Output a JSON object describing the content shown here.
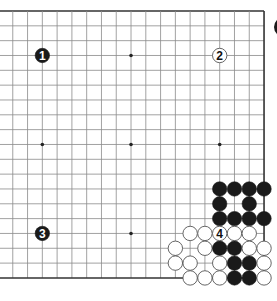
{
  "diagram": {
    "board_size": 19,
    "colors": {
      "background": "#ffffff",
      "grid_line": "#8a8a8a",
      "edge_line": "#333333",
      "black_stone": "#1a1a1a",
      "white_stone_fill": "#ffffff",
      "white_stone_stroke": "#555555",
      "star_point": "#222222"
    },
    "geometry": {
      "origin_x": -2,
      "origin_y": 11,
      "spacing_x": 14.78,
      "spacing_y": 14.83,
      "stone_radius": 7.2
    },
    "star_points": [
      [
        3,
        3
      ],
      [
        9,
        3
      ],
      [
        15,
        3
      ],
      [
        3,
        9
      ],
      [
        9,
        9
      ],
      [
        15,
        9
      ],
      [
        3,
        15
      ],
      [
        9,
        15
      ],
      [
        15,
        15
      ]
    ],
    "numbered_stones": [
      {
        "col": 3,
        "row": 3,
        "color": "black",
        "label": "1"
      },
      {
        "col": 15,
        "row": 3,
        "color": "white",
        "label": "2"
      },
      {
        "col": 3,
        "row": 15,
        "color": "black",
        "label": "3"
      },
      {
        "col": 15,
        "row": 15,
        "color": "white",
        "label": "4"
      }
    ],
    "stones": [
      {
        "col": 15,
        "row": 12,
        "color": "black"
      },
      {
        "col": 16,
        "row": 12,
        "color": "black"
      },
      {
        "col": 17,
        "row": 12,
        "color": "black"
      },
      {
        "col": 18,
        "row": 12,
        "color": "black"
      },
      {
        "col": 15,
        "row": 13,
        "color": "black"
      },
      {
        "col": 17,
        "row": 13,
        "color": "black"
      },
      {
        "col": 15,
        "row": 14,
        "color": "black"
      },
      {
        "col": 16,
        "row": 14,
        "color": "black"
      },
      {
        "col": 17,
        "row": 14,
        "color": "black"
      },
      {
        "col": 18,
        "row": 14,
        "color": "black"
      },
      {
        "col": 13,
        "row": 15,
        "color": "white"
      },
      {
        "col": 14,
        "row": 15,
        "color": "white"
      },
      {
        "col": 16,
        "row": 15,
        "color": "white"
      },
      {
        "col": 17,
        "row": 15,
        "color": "white"
      },
      {
        "col": 12,
        "row": 16,
        "color": "white"
      },
      {
        "col": 14,
        "row": 16,
        "color": "white"
      },
      {
        "col": 15,
        "row": 16,
        "color": "black"
      },
      {
        "col": 16,
        "row": 16,
        "color": "black"
      },
      {
        "col": 17,
        "row": 16,
        "color": "white"
      },
      {
        "col": 18,
        "row": 16,
        "color": "white"
      },
      {
        "col": 12,
        "row": 17,
        "color": "white"
      },
      {
        "col": 13,
        "row": 17,
        "color": "white"
      },
      {
        "col": 15,
        "row": 17,
        "color": "white"
      },
      {
        "col": 16,
        "row": 17,
        "color": "black"
      },
      {
        "col": 17,
        "row": 17,
        "color": "black"
      },
      {
        "col": 18,
        "row": 17,
        "color": "white"
      },
      {
        "col": 13,
        "row": 18,
        "color": "white"
      },
      {
        "col": 14,
        "row": 18,
        "color": "white"
      },
      {
        "col": 15,
        "row": 18,
        "color": "white"
      },
      {
        "col": 16,
        "row": 18,
        "color": "black"
      },
      {
        "col": 17,
        "row": 18,
        "color": "black"
      },
      {
        "col": 18,
        "row": 18,
        "color": "white"
      }
    ],
    "clipped_stone": {
      "cx": 284,
      "cy": 27,
      "r": 10,
      "color": "black"
    }
  }
}
